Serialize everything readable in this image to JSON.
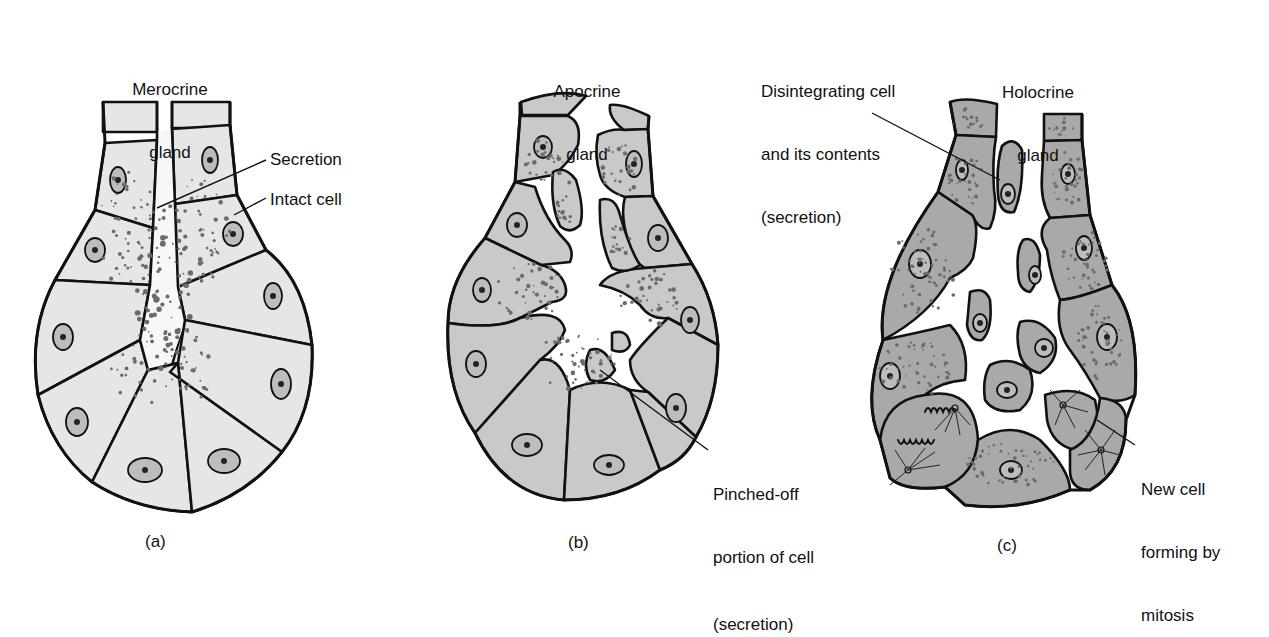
{
  "figure": {
    "panels": [
      {
        "id": "a",
        "letter": "(a)",
        "title_line1": "Merocrine",
        "title_line2": "gland",
        "labels": [
          {
            "text": "Secretion"
          },
          {
            "text": "Intact cell"
          }
        ]
      },
      {
        "id": "b",
        "letter": "(b)",
        "title_line1": "Apocrine",
        "title_line2": "gland",
        "labels": [
          {
            "line1": "Pinched-off",
            "line2": "portion of cell",
            "line3": "(secretion)"
          }
        ]
      },
      {
        "id": "c",
        "letter": "(c)",
        "title_line1": "Holocrine",
        "title_line2": "gland",
        "labels": [
          {
            "line1": "Disintegrating cell",
            "line2": "and its contents",
            "line3": "(secretion)"
          },
          {
            "line1": "New cell",
            "line2": "forming by",
            "line3": "mitosis"
          }
        ]
      }
    ],
    "colors": {
      "merocrine_fill": "#e6e6e6",
      "apocrine_fill": "#c9c9c9",
      "holocrine_fill": "#a9a9a9",
      "outline": "#111111"
    }
  }
}
